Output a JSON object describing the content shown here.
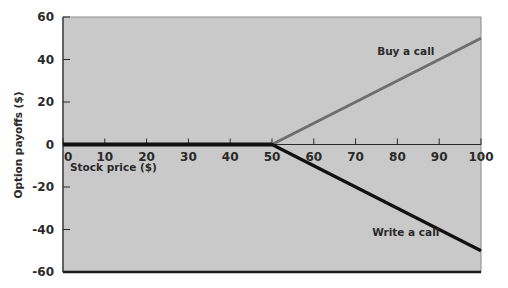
{
  "chart_data": {
    "type": "line",
    "title": "",
    "xlabel": "Stock price ($)",
    "ylabel": "Option payoffs ($)",
    "xlim": [
      0,
      100
    ],
    "ylim": [
      -60,
      60
    ],
    "x_ticks": [
      "0",
      "10",
      "20",
      "30",
      "40",
      "50",
      "60",
      "70",
      "80",
      "90",
      "100"
    ],
    "y_ticks": [
      "60",
      "40",
      "20",
      "0",
      "-20",
      "-40",
      "-60"
    ],
    "grid": false,
    "legend": "none",
    "x": [
      0,
      10,
      20,
      30,
      40,
      50,
      60,
      70,
      80,
      90,
      100
    ],
    "series": [
      {
        "name": "Buy a call",
        "color": "#6e6e6e",
        "values": [
          0,
          0,
          0,
          0,
          0,
          0,
          10,
          20,
          30,
          40,
          50
        ]
      },
      {
        "name": "Write a call",
        "color": "#111111",
        "values": [
          0,
          0,
          0,
          0,
          0,
          0,
          -10,
          -20,
          -30,
          -40,
          -50
        ]
      }
    ],
    "annotations": [
      {
        "text": "Buy a call",
        "x": 82,
        "y": 42
      },
      {
        "text": "Write a call",
        "x": 82,
        "y": -43
      }
    ],
    "strike_price": 50
  },
  "colors": {
    "plot_background": "#c8c8c8",
    "buy_line": "#6e6e6e",
    "write_line": "#111111",
    "axis": "#2a2a2a"
  }
}
